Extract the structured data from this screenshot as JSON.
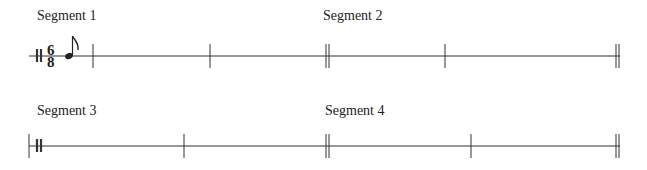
{
  "segments": [
    {
      "label": "Segment 1",
      "x": 37,
      "y": 8
    },
    {
      "label": "Segment 2",
      "x": 323,
      "y": 8
    },
    {
      "label": "Segment 3",
      "x": 37,
      "y": 103
    },
    {
      "label": "Segment 4",
      "x": 325,
      "y": 103
    }
  ],
  "time_signature": {
    "numerator": "6",
    "denominator": "8"
  },
  "note": {
    "type": "eighth-note"
  },
  "colors": {
    "ink": "#222222",
    "background": "#ffffff"
  }
}
